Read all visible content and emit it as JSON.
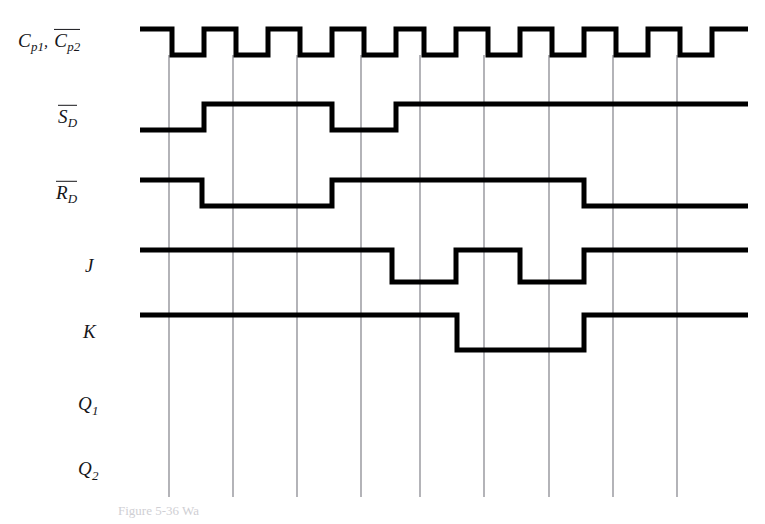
{
  "figure": {
    "caption": "Figure 5-36 Wa",
    "width": 765,
    "height": 524,
    "colors": {
      "waveform": "#000000",
      "grid": "#7c7c84",
      "label": "#16161a",
      "background": "#ffffff"
    }
  },
  "signals": [
    {
      "key": "clock",
      "name": "clock-row",
      "label_parts": [
        {
          "base": "C",
          "sub": "p1",
          "overline": false
        },
        {
          "base": ",",
          "sub": "",
          "overline": false
        },
        {
          "base": "C",
          "sub": "p2",
          "overline": true
        }
      ],
      "label_text": "C p1, C p2",
      "label_x": 18,
      "label_y": 42,
      "y_high": 29,
      "y_low": 55,
      "x_start": 140,
      "x_end": 748,
      "start_level": "high",
      "transitions": [
        172,
        204,
        236,
        268,
        300,
        332,
        364,
        396,
        424,
        456,
        488,
        520,
        552,
        584,
        616,
        648,
        680,
        712
      ],
      "has_waveform": true
    },
    {
      "key": "sd",
      "name": "s-d-bar-row",
      "label_parts": [
        {
          "base": "S",
          "sub": "D",
          "overline": true
        }
      ],
      "label_text": "S D",
      "label_x": 58,
      "label_y": 117,
      "y_high": 104,
      "y_low": 130,
      "x_start": 140,
      "x_end": 748,
      "start_level": "low",
      "transitions": [
        204,
        332,
        396
      ],
      "has_waveform": true
    },
    {
      "key": "rd",
      "name": "r-d-bar-row",
      "label_parts": [
        {
          "base": "R",
          "sub": "D",
          "overline": true
        }
      ],
      "label_text": "R D",
      "label_x": 56,
      "label_y": 193,
      "y_high": 180,
      "y_low": 206,
      "x_start": 140,
      "x_end": 748,
      "start_level": "high",
      "transitions": [
        202,
        332,
        584
      ],
      "has_waveform": true
    },
    {
      "key": "j",
      "name": "j-row",
      "label_parts": [
        {
          "base": "J",
          "sub": "",
          "overline": false
        }
      ],
      "label_text": "J",
      "label_x": 85,
      "label_y": 266,
      "y_high": 250,
      "y_low": 282,
      "x_start": 140,
      "x_end": 748,
      "start_level": "high",
      "transitions": [
        392,
        456,
        520,
        584
      ],
      "has_waveform": true
    },
    {
      "key": "k",
      "name": "k-row",
      "label_parts": [
        {
          "base": "K",
          "sub": "",
          "overline": false
        }
      ],
      "label_text": "K",
      "label_x": 83,
      "label_y": 332,
      "y_high": 315,
      "y_low": 350,
      "x_start": 140,
      "x_end": 748,
      "start_level": "high",
      "transitions": [
        457,
        584
      ],
      "has_waveform": true
    },
    {
      "key": "q1",
      "name": "q1-row",
      "label_parts": [
        {
          "base": "Q",
          "sub": "1",
          "overline": false
        }
      ],
      "label_text": "Q 1",
      "label_x": 78,
      "label_y": 406,
      "y_high": 393,
      "y_low": 420,
      "x_start": 140,
      "x_end": 748,
      "start_level": "low",
      "transitions": [],
      "has_waveform": false
    },
    {
      "key": "q2",
      "name": "q2-row",
      "label_parts": [
        {
          "base": "Q",
          "sub": "2",
          "overline": false
        }
      ],
      "label_text": "Q 2",
      "label_x": 78,
      "label_y": 471,
      "y_high": 458,
      "y_low": 485,
      "x_start": 140,
      "x_end": 748,
      "start_level": "low",
      "transitions": [],
      "has_waveform": false
    }
  ],
  "grid": {
    "x_positions": [
      169,
      233,
      297,
      361,
      420,
      484,
      549,
      613,
      677
    ],
    "y_top": 55,
    "y_bottom": 497,
    "visible": true
  }
}
